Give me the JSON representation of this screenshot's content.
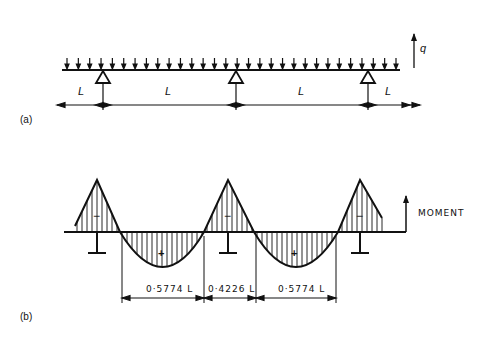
{
  "figure": {
    "part_a": {
      "label": "(a)",
      "load_symbol": "q",
      "span_labels": [
        "L",
        "L",
        "L",
        "L"
      ],
      "supports": 3,
      "load_arrow_count": 30
    },
    "part_b": {
      "label": "(b)",
      "axis_label": "MOMENT",
      "sign_negative": "−",
      "sign_positive": "+",
      "dimensions": [
        "0·5774 L",
        "0·4226 L",
        "0·5774 L"
      ]
    }
  },
  "colors": {
    "ink": "#111111",
    "background": "#ffffff"
  }
}
